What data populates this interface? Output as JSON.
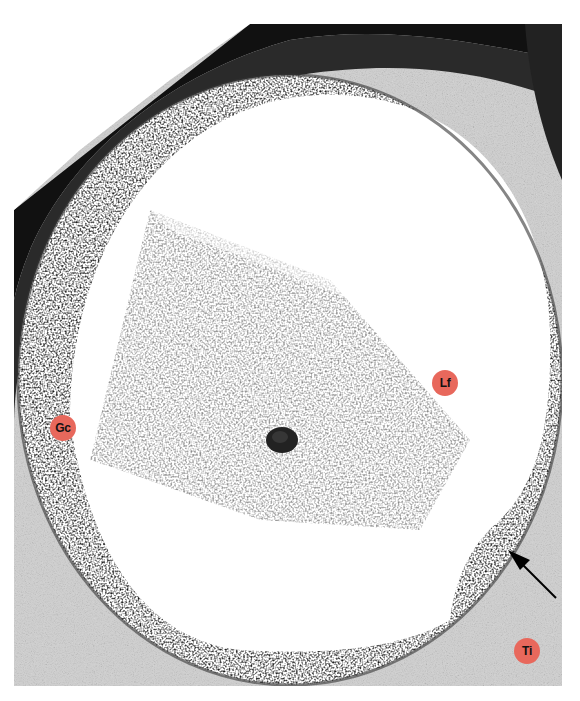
{
  "figure": {
    "label_color": "#e8685c",
    "labels": [
      {
        "id": "gc",
        "text": "Gc",
        "x": 63,
        "y": 428
      },
      {
        "id": "lf",
        "text": "Lf",
        "x": 445,
        "y": 383
      },
      {
        "id": "ti",
        "text": "Ti",
        "x": 527,
        "y": 651
      }
    ],
    "arrow": {
      "from": [
        556,
        598
      ],
      "to": [
        510,
        552
      ]
    }
  }
}
